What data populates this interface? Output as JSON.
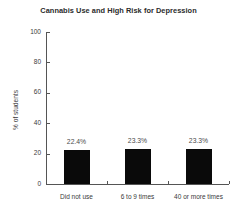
{
  "chart_data": {
    "type": "bar",
    "title": "Cannabis Use and High Risk for Depression",
    "xlabel": "",
    "ylabel": "% of students",
    "categories": [
      "Did not use",
      "6 to 9 times",
      "40 or more times"
    ],
    "values": [
      22.4,
      23.3,
      23.3
    ],
    "value_labels": [
      "22.4%",
      "23.3%",
      "23.3%"
    ],
    "ylim": [
      0,
      100
    ],
    "yticks": [
      0,
      20,
      40,
      60,
      80,
      100
    ],
    "ytick_labels": [
      "0",
      "20",
      "40",
      "60",
      "80",
      "100"
    ],
    "grid": false,
    "legend": false,
    "bar_color": "#0a0a0a",
    "axis_color": "#555555",
    "text_color": "#3a3a3a",
    "background": "#ffffff"
  }
}
